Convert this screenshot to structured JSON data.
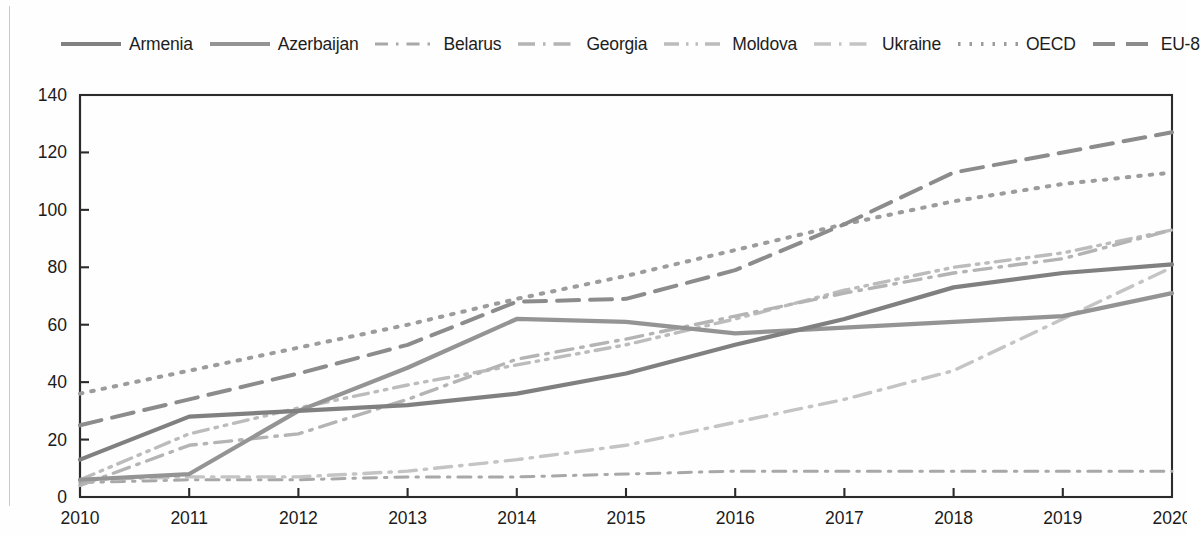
{
  "chart_data": {
    "type": "line",
    "title": "",
    "xlabel": "",
    "ylabel": "",
    "x": [
      2010,
      2011,
      2012,
      2013,
      2014,
      2015,
      2016,
      2017,
      2018,
      2019,
      2020
    ],
    "categories": [
      "2010",
      "2011",
      "2012",
      "2013",
      "2014",
      "2015",
      "2016",
      "2017",
      "2018",
      "2019",
      "2020"
    ],
    "ylim": [
      0,
      140
    ],
    "xlim": [
      2010,
      2020
    ],
    "yticks": [
      0,
      20,
      40,
      60,
      80,
      100,
      120,
      140
    ],
    "ytick_labels": [
      "0",
      "20",
      "40",
      "60",
      "80",
      "100",
      "120",
      "140"
    ],
    "grid": false,
    "legend_position": "top",
    "series": [
      {
        "name": "Armenia",
        "color": "#808080",
        "style": "solid",
        "values": [
          13,
          28,
          30,
          32,
          36,
          43,
          53,
          62,
          73,
          78,
          81
        ]
      },
      {
        "name": "Azerbaijan",
        "color": "#949494",
        "style": "solid",
        "values": [
          6,
          8,
          30,
          45,
          62,
          61,
          57,
          59,
          61,
          63,
          71
        ]
      },
      {
        "name": "Belarus",
        "color": "#a8a8a8",
        "style": "long-dash-dot",
        "values": [
          5,
          6,
          6,
          7,
          7,
          8,
          9,
          9,
          9,
          9,
          9
        ]
      },
      {
        "name": "Georgia",
        "color": "#b4b4b4",
        "style": "dash-dot",
        "values": [
          4,
          18,
          22,
          34,
          48,
          55,
          63,
          71,
          78,
          83,
          93
        ]
      },
      {
        "name": "Moldova",
        "color": "#bcbcbc",
        "style": "dash-dot-dot",
        "values": [
          6,
          22,
          31,
          39,
          46,
          53,
          62,
          72,
          80,
          85,
          93
        ]
      },
      {
        "name": "Ukraine",
        "color": "#c4c4c4",
        "style": "dash-dot",
        "values": [
          6,
          7,
          7,
          9,
          13,
          18,
          26,
          34,
          44,
          62,
          80
        ]
      },
      {
        "name": "OECD",
        "color": "#9c9c9c",
        "style": "dotted",
        "values": [
          36,
          44,
          52,
          60,
          69,
          77,
          86,
          95,
          103,
          109,
          113
        ]
      },
      {
        "name": "EU-8",
        "color": "#8c8c8c",
        "style": "dashed",
        "values": [
          25,
          34,
          43,
          53,
          68,
          69,
          79,
          95,
          113,
          120,
          127
        ]
      }
    ]
  },
  "legend": {
    "items": [
      {
        "label": "Armenia",
        "swatch": "line-swatch-solid-thick"
      },
      {
        "label": "Azerbaijan",
        "swatch": "line-swatch-solid-thick"
      },
      {
        "label": "Belarus",
        "swatch": "line-swatch-dash-dot"
      },
      {
        "label": "Georgia",
        "swatch": "line-swatch-dash-dot"
      },
      {
        "label": "Moldova",
        "swatch": "line-swatch-dash-dot-dot"
      },
      {
        "label": "Ukraine",
        "swatch": "line-swatch-dash-dot"
      },
      {
        "label": "OECD",
        "swatch": "line-swatch-dotted"
      },
      {
        "label": "EU-8",
        "swatch": "line-swatch-dashed"
      }
    ]
  }
}
